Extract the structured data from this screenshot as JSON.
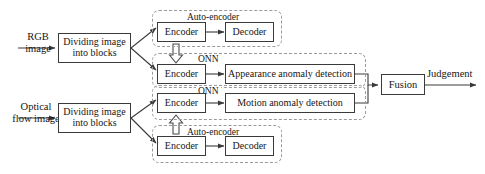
{
  "diagram": {
    "colors": {
      "background": "#ffffff",
      "box_border": "#3a3a3a",
      "group_border": "#9a9a9a",
      "text": "#161616",
      "arrow": "#3a3a3a"
    },
    "inputs": {
      "rgb": "RGB\nimage",
      "rgb_line1": "RGB",
      "rgb_line2": "image",
      "optical_line1": "Optical",
      "optical_line2": "flow image"
    },
    "blocks": {
      "dividing_line1": "Dividing image",
      "dividing_line2": "into blocks",
      "encoder": "Encoder",
      "decoder": "Decoder",
      "appearance": "Appearance anomaly detection",
      "motion": "Motion anomaly detection",
      "fusion": "Fusion"
    },
    "groups": {
      "auto_encoder": "Auto-encoder",
      "onn": "ONN"
    },
    "outputs": {
      "judgement": "Judgement"
    },
    "nodes": [
      {
        "id": "dividing-top",
        "label_line1": "Dividing image",
        "label_line2": "into blocks"
      },
      {
        "id": "dividing-bottom",
        "label_line1": "Dividing image",
        "label_line2": "into blocks"
      },
      {
        "id": "encoder-ae-top",
        "label": "Encoder"
      },
      {
        "id": "decoder-ae-top",
        "label": "Decoder"
      },
      {
        "id": "encoder-onn-top",
        "label": "Encoder"
      },
      {
        "id": "appearance-detection",
        "label": "Appearance anomaly detection"
      },
      {
        "id": "encoder-onn-bottom",
        "label": "Encoder"
      },
      {
        "id": "motion-detection",
        "label": "Motion anomaly detection"
      },
      {
        "id": "encoder-ae-bottom",
        "label": "Encoder"
      },
      {
        "id": "decoder-ae-bottom",
        "label": "Decoder"
      },
      {
        "id": "fusion",
        "label": "Fusion"
      }
    ]
  }
}
